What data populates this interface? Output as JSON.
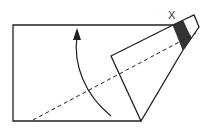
{
  "diagram": {
    "label_x": "X",
    "colors": {
      "stroke": "#222222",
      "shaded": "#333333",
      "background": "#ffffff"
    }
  }
}
